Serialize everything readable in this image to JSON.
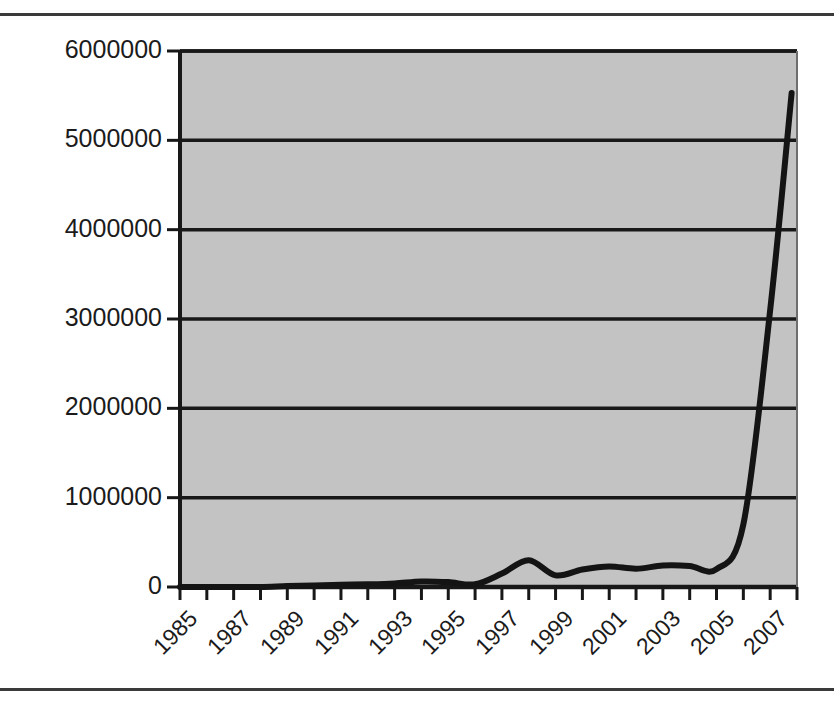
{
  "figure": {
    "kind": "scanned-line-chart",
    "background_color": "#ffffff",
    "frame_rule_color": "#3a3a3a"
  },
  "chart_data": {
    "type": "line",
    "title": "",
    "subtitle": "",
    "xlabel": "",
    "ylabel": "",
    "legend": [],
    "legend_position": "none",
    "grid": true,
    "grid_axis": "y",
    "plot_background_color": "#c3c3c3",
    "line_color": "#141414",
    "line_width_px": 6,
    "xlim": [
      1985,
      2008
    ],
    "ylim": [
      0,
      6000000
    ],
    "ytick_values": [
      0,
      1000000,
      2000000,
      3000000,
      4000000,
      5000000,
      6000000
    ],
    "ytick_labels": [
      "0",
      "1000000",
      "2000000",
      "3000000",
      "4000000",
      "5000000",
      "6000000"
    ],
    "xtick_values": [
      1985,
      1986,
      1987,
      1988,
      1989,
      1990,
      1991,
      1992,
      1993,
      1994,
      1995,
      1996,
      1997,
      1998,
      1999,
      2000,
      2001,
      2002,
      2003,
      2004,
      2005,
      2006,
      2007,
      2008
    ],
    "xtick_labels_shown": [
      "1985",
      "1987",
      "1989",
      "1991",
      "1993",
      "1995",
      "1997",
      "1999",
      "2001",
      "2003",
      "2005",
      "2007"
    ],
    "xtick_label_rotation_deg": -45,
    "x": [
      1985,
      1986,
      1987,
      1988,
      1989,
      1990,
      1991,
      1992,
      1993,
      1994,
      1995,
      1996,
      1997,
      1998,
      1999,
      2000,
      2001,
      2002,
      2003,
      2004,
      2005,
      2006,
      2007,
      2007.8
    ],
    "values": [
      0,
      0,
      0,
      0,
      10000,
      18000,
      25000,
      30000,
      40000,
      62000,
      55000,
      30000,
      150000,
      300000,
      130000,
      195000,
      230000,
      205000,
      240000,
      235000,
      200000,
      700000,
      3100000,
      5530000
    ],
    "series": [
      {
        "name": "value",
        "values": [
          0,
          0,
          0,
          0,
          10000,
          18000,
          25000,
          30000,
          40000,
          62000,
          55000,
          30000,
          150000,
          300000,
          130000,
          195000,
          230000,
          205000,
          240000,
          235000,
          200000,
          700000,
          3100000,
          5530000
        ]
      }
    ]
  }
}
